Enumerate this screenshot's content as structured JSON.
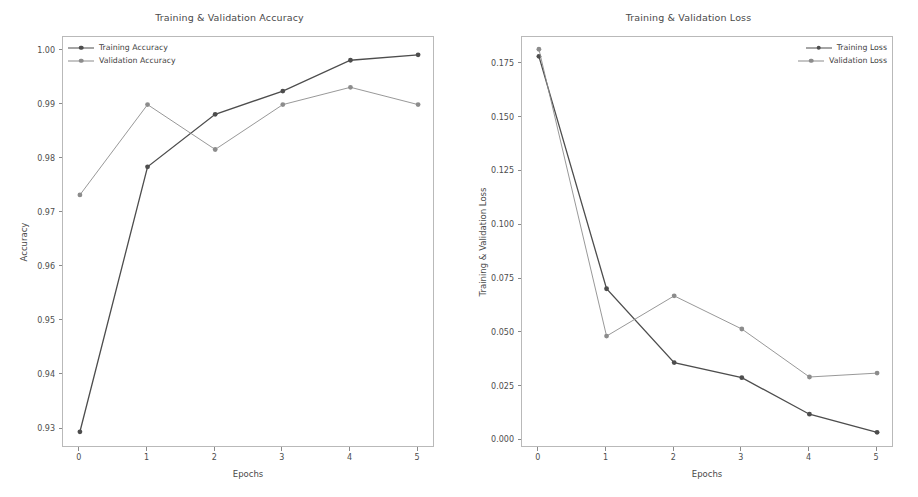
{
  "figure": {
    "width": 918,
    "height": 497,
    "background": "#ffffff"
  },
  "chart_data": [
    {
      "type": "line",
      "panel": "left",
      "title": "Training & Validation Accuracy",
      "xlabel": "Epochs",
      "ylabel": "Accuracy",
      "x": [
        0,
        1,
        2,
        3,
        4,
        5
      ],
      "xticks": [
        "0",
        "1",
        "2",
        "3",
        "4",
        "5"
      ],
      "yticks": [
        "0.93",
        "0.94",
        "0.95",
        "0.96",
        "0.97",
        "0.98",
        "0.99",
        "1.00"
      ],
      "ytick_values": [
        0.93,
        0.94,
        0.95,
        0.96,
        0.97,
        0.98,
        0.99,
        1.0
      ],
      "xlim": [
        -0.25,
        5.25
      ],
      "ylim": [
        0.9265,
        1.0025
      ],
      "grid": false,
      "legend_position": "upper left",
      "series": [
        {
          "name": "Training Accuracy",
          "color": "#4d4d4d",
          "linewidth": 1.3,
          "marker": "o",
          "values": [
            0.9295,
            0.9785,
            0.9882,
            0.9925,
            0.9982,
            0.9992
          ]
        },
        {
          "name": "Validation Accuracy",
          "color": "#8c8c8c",
          "linewidth": 0.9,
          "marker": "o",
          "values": [
            0.9733,
            0.99,
            0.9817,
            0.99,
            0.9932,
            0.99
          ]
        }
      ]
    },
    {
      "type": "line",
      "panel": "right",
      "title": "Training & Validation Loss",
      "xlabel": "Epochs",
      "ylabel": "Training & Validation Loss",
      "x": [
        0,
        1,
        2,
        3,
        4,
        5
      ],
      "xticks": [
        "0",
        "1",
        "2",
        "3",
        "4",
        "5"
      ],
      "yticks": [
        "0.000",
        "0.025",
        "0.050",
        "0.075",
        "0.100",
        "0.125",
        "0.150",
        "0.175"
      ],
      "ytick_values": [
        0.0,
        0.025,
        0.05,
        0.075,
        0.1,
        0.125,
        0.15,
        0.175
      ],
      "xlim": [
        -0.25,
        5.25
      ],
      "ylim": [
        -0.0035,
        0.1875
      ],
      "grid": false,
      "legend_position": "upper right",
      "series": [
        {
          "name": "Training Loss",
          "color": "#4d4d4d",
          "linewidth": 1.3,
          "marker": "o",
          "values": [
            0.1785,
            0.0705,
            0.0362,
            0.0292,
            0.0122,
            0.0038
          ]
        },
        {
          "name": "Validation Loss",
          "color": "#8c8c8c",
          "linewidth": 0.9,
          "marker": "o",
          "values": [
            0.1818,
            0.0485,
            0.0672,
            0.0518,
            0.0295,
            0.0313
          ]
        }
      ]
    }
  ]
}
